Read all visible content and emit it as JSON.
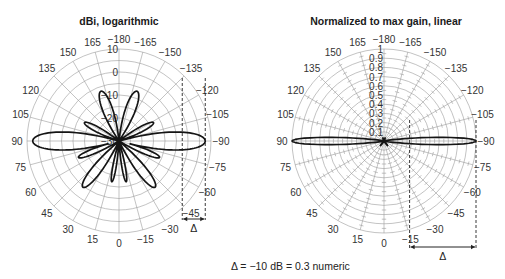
{
  "chart_data": [
    {
      "type": "polar",
      "title": "dBi, logarithmic",
      "scale": "logarithmic",
      "unit": "dBi",
      "radial_ticks": [
        "10",
        "0",
        "-10",
        "-20",
        "-30"
      ],
      "radial_range": [
        -30,
        10
      ],
      "radial_ring_step": 5,
      "angle_ticks": [
        "-180",
        "-165",
        "-150",
        "-135",
        "-120",
        "-105",
        "-90",
        "-75",
        "-60",
        "-45",
        "-30",
        "-15",
        "0",
        "15",
        "30",
        "45",
        "60",
        "75",
        "90",
        "105",
        "120",
        "135",
        "150",
        "165"
      ],
      "angle_convention": "0 at bottom, 90 at left, -90 at right, ±180 at top",
      "lobes": [
        {
          "angle": 90,
          "peak": 7.5,
          "width": 14
        },
        {
          "angle": -90,
          "peak": 7.5,
          "width": 14
        },
        {
          "angle": 160,
          "peak": -7,
          "width": 16
        },
        {
          "angle": -160,
          "peak": -7,
          "width": 16
        },
        {
          "angle": 118,
          "peak": -13,
          "width": 13
        },
        {
          "angle": -118,
          "peak": -13,
          "width": 13
        },
        {
          "angle": 68,
          "peak": -11,
          "width": 11
        },
        {
          "angle": -68,
          "peak": -11,
          "width": 11
        },
        {
          "angle": 38,
          "peak": -4.5,
          "width": 13
        },
        {
          "angle": -38,
          "peak": -4.5,
          "width": 13
        },
        {
          "angle": 10,
          "peak": -12,
          "width": 8
        },
        {
          "angle": -10,
          "peak": -12,
          "width": 8
        }
      ],
      "annotation": {
        "label": "Δ",
        "from_dB": 7.5,
        "to_dB": -2.5,
        "delta_dB": -10
      }
    },
    {
      "type": "polar",
      "title": "Normalized to max gain, linear",
      "scale": "linear",
      "unit": "normalized",
      "radial_ticks": [
        "1",
        "0.9",
        "0.8",
        "0.7",
        "0.6",
        "0.5",
        "0.4",
        "0.3",
        "0.2",
        "0.1"
      ],
      "radial_range": [
        0,
        1
      ],
      "angle_ticks": [
        "-180",
        "-165",
        "-150",
        "-135",
        "-120",
        "-105",
        "-90",
        "-75",
        "-60",
        "-45",
        "-30",
        "-15",
        "0",
        "15",
        "30",
        "45",
        "60",
        "75",
        "90",
        "105",
        "120",
        "135",
        "150",
        "165"
      ],
      "lobes": [
        {
          "angle": 90,
          "peak": 1.0
        },
        {
          "angle": -90,
          "peak": 1.0
        },
        {
          "angle": 160,
          "peak": 0.22
        },
        {
          "angle": -160,
          "peak": 0.22
        },
        {
          "angle": 38,
          "peak": 0.28
        },
        {
          "angle": -38,
          "peak": 0.28
        },
        {
          "angle": 68,
          "peak": 0.14
        },
        {
          "angle": -68,
          "peak": 0.14
        },
        {
          "angle": 118,
          "peak": 0.11
        },
        {
          "angle": -118,
          "peak": 0.11
        },
        {
          "angle": 10,
          "peak": 0.12
        },
        {
          "angle": -10,
          "peak": 0.12
        }
      ],
      "annotation": {
        "label": "Δ",
        "from": 1.0,
        "to": 0.3
      }
    }
  ],
  "caption": "Δ = −10 dB = 0.3 numeric",
  "delta_label": "Δ",
  "left": {
    "title": "dBi, logarithmic",
    "center_label": "-30"
  },
  "right": {
    "title": "Normalized to max gain, linear"
  }
}
